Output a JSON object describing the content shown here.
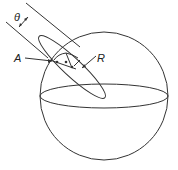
{
  "diagram": {
    "labels": {
      "theta": "θ",
      "a": "A",
      "r": "R"
    },
    "colors": {
      "stroke": "#333333",
      "background": "#ffffff"
    },
    "sphere": {
      "cx": 104,
      "cy": 96,
      "r": 64
    },
    "equator": {
      "cx": 104,
      "cy": 96,
      "rx": 64,
      "ry": 12
    },
    "tilted_ellipse": {
      "cx": 72,
      "cy": 67,
      "rx": 45,
      "ry": 9,
      "angle": 43
    }
  }
}
